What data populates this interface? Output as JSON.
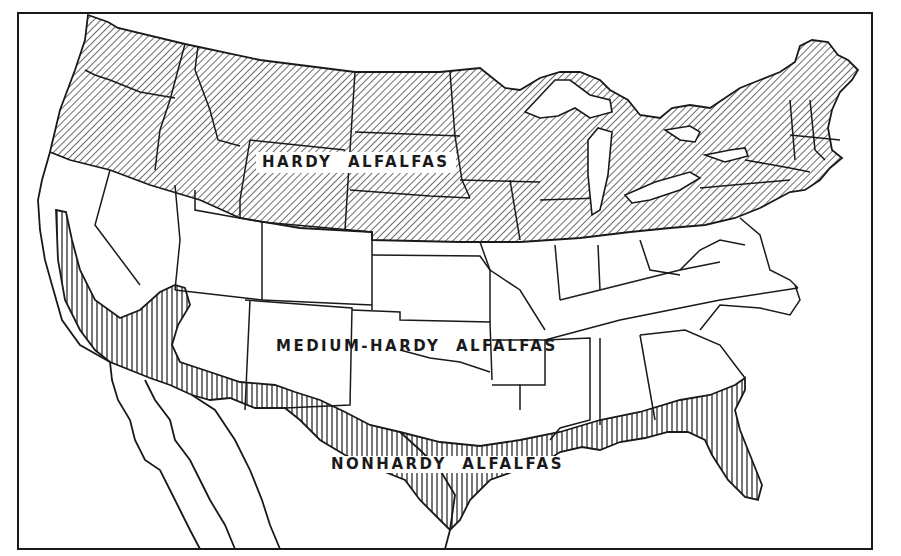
{
  "map": {
    "title": "",
    "regions": [
      {
        "id": "hardy",
        "label": "HARDY  ALFALFAS",
        "pattern": "diagonal-hatch"
      },
      {
        "id": "medium-hardy",
        "label": "MEDIUM-HARDY  ALFALFAS",
        "pattern": "none"
      },
      {
        "id": "nonhardy",
        "label": "NONHARDY  ALFALFAS",
        "pattern": "vertical-hatch"
      }
    ],
    "colors": {
      "ink": "#1a1a1a",
      "paper": "#ffffff"
    }
  }
}
